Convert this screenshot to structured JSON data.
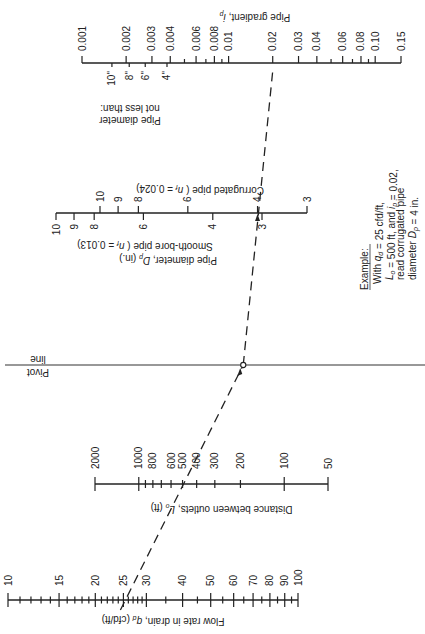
{
  "figure": {
    "type": "nomograph",
    "orientation": "rotated"
  },
  "axes": {
    "flow_rate": {
      "title": "Flow rate in drain, q_d (cfd/ft)",
      "major_labels": [
        "10",
        "15",
        "20",
        "25",
        "30",
        "40",
        "50",
        "60",
        "70",
        "80",
        "90",
        "100"
      ],
      "major_values": [
        10,
        15,
        20,
        25,
        30,
        40,
        50,
        60,
        70,
        80,
        90,
        100
      ],
      "minor_values": [
        11,
        12,
        13,
        14,
        16,
        17,
        18,
        19,
        21,
        22,
        23,
        24,
        26,
        27,
        28,
        29,
        35,
        45,
        55,
        65,
        75,
        85,
        95
      ],
      "range": [
        10,
        100
      ],
      "scale": "log"
    },
    "distance": {
      "title": "Distance between outlets, L_o (ft)",
      "major_labels": [
        "2000",
        "1000",
        "800",
        "600",
        "500",
        "400",
        "300",
        "200",
        "100",
        "50"
      ],
      "major_values": [
        2000,
        1000,
        800,
        600,
        500,
        400,
        300,
        200,
        100,
        50
      ],
      "minor_values": [
        900,
        700
      ],
      "range": [
        2000,
        50
      ],
      "scale": "log"
    },
    "pivot": {
      "label_line1": "Pivot",
      "label_line2": "line"
    },
    "pipe_diameter": {
      "title": "Pipe diameter, D_p (in.)",
      "corrugated_label": "Corrugated pipe ( n_f = 0.024)",
      "smooth_label": "Smooth-bore pipe ( n_f = 0.013)",
      "corrugated_values": [
        10,
        9,
        8,
        6,
        4,
        3
      ],
      "corrugated_labels": [
        "10",
        "9",
        "8",
        "6",
        "4",
        "3"
      ],
      "smooth_values": [
        10,
        9,
        8,
        6,
        4,
        3
      ],
      "smooth_labels": [
        "10",
        "9",
        "8",
        "6",
        "4",
        "3"
      ]
    },
    "gradient": {
      "title": "Pipe gradient, i_p",
      "major_labels": [
        "0.001",
        "0.002",
        "0.003",
        "0.004",
        "0.006",
        "0.008",
        "0.01",
        "0.02",
        "0.03",
        "0.04",
        "0.06",
        "0.08",
        "0.10",
        "0.15"
      ],
      "major_values": [
        0.001,
        0.002,
        0.003,
        0.004,
        0.006,
        0.008,
        0.01,
        0.02,
        0.03,
        0.04,
        0.06,
        0.08,
        0.1,
        0.15
      ],
      "minor_values": [
        0.005,
        0.007,
        0.009,
        0.05,
        0.07,
        0.09
      ],
      "range": [
        0.001,
        0.15
      ],
      "scale": "log",
      "min_diameter_title_line1": "Pipe diameter",
      "min_diameter_title_line2": "not less than:",
      "min_diameter_labels": [
        "10\"",
        "8\"",
        "6\"",
        "4\""
      ],
      "min_diameter_at_gradient": [
        0.0016,
        0.0021,
        0.0027,
        0.0038
      ]
    }
  },
  "example": {
    "heading": "Example:",
    "lines": [
      "With q_d = 25 cfd/ft,",
      "L_o = 500 ft, and i_p = 0.02,",
      "read corrugated pipe",
      "diameter D_p = 4 in."
    ],
    "q_d": 25,
    "L_o": 500,
    "i_p": 0.02,
    "D_p": 4
  }
}
